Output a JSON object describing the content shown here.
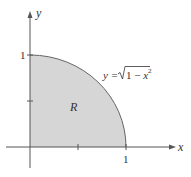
{
  "diagram": {
    "type": "quarter-circle region",
    "axes": {
      "x_label": "x",
      "y_label": "y",
      "x_tick_label": "1",
      "y_tick_label": "1"
    },
    "region_label": "R",
    "curve_label_prefix": "y = ",
    "curve_label_radicand": "1 − x",
    "curve_label_exponent": "2",
    "colors": {
      "region_fill": "#d6d6d6",
      "axis": "#555555",
      "curve": "#666666",
      "text": "#333333"
    }
  }
}
